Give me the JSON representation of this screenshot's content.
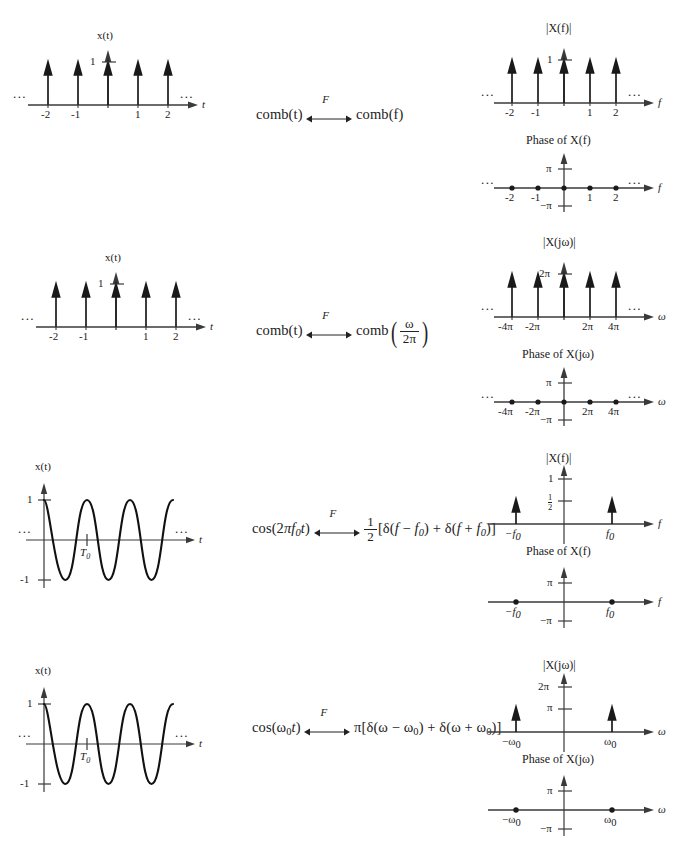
{
  "figure": {
    "type": "signal-transform-table",
    "rows": [
      {
        "id": "row1-comb-f",
        "time_plot": {
          "y_axis_label": "x(t)",
          "x_axis_label": "t",
          "y_tick_labels": [
            "1"
          ],
          "x_tick_labels": [
            "-2",
            "-1",
            "1",
            "2"
          ],
          "left_ellipsis": "...",
          "right_ellipsis": "...",
          "impulse_positions": [
            -2,
            -1,
            0,
            1,
            2
          ],
          "impulse_height": 1
        },
        "equation": {
          "lhs": "comb(t)",
          "operator_label": "F",
          "rhs": "comb(f)"
        },
        "magnitude_plot": {
          "title": "|X(f)|",
          "x_axis_label": "f",
          "y_tick_labels": [
            "1"
          ],
          "x_tick_labels": [
            "-2",
            "-1",
            "1",
            "2"
          ],
          "left_ellipsis": "...",
          "right_ellipsis": "...",
          "impulse_positions": [
            -2,
            -1,
            0,
            1,
            2
          ],
          "impulse_height": 1
        },
        "phase_plot": {
          "title": "Phase of X(f)",
          "x_axis_label": "f",
          "y_tick_labels": [
            "π",
            "−π"
          ],
          "x_tick_labels": [
            "-2",
            "-1",
            "1",
            "2"
          ],
          "left_ellipsis": "...",
          "right_ellipsis": "...",
          "point_positions": [
            -2,
            -1,
            0,
            1,
            2
          ],
          "point_values": [
            0,
            0,
            0,
            0,
            0
          ]
        }
      },
      {
        "id": "row2-comb-omega",
        "time_plot": {
          "y_axis_label": "x(t)",
          "x_axis_label": "t",
          "y_tick_labels": [
            "1"
          ],
          "x_tick_labels": [
            "-2",
            "-1",
            "1",
            "2"
          ],
          "left_ellipsis": "...",
          "right_ellipsis": "...",
          "impulse_positions": [
            -2,
            -1,
            0,
            1,
            2
          ],
          "impulse_height": 1
        },
        "equation": {
          "lhs": "comb(t)",
          "operator_label": "F",
          "rhs_prefix": "comb",
          "rhs_fraction_num": "ω",
          "rhs_fraction_den": "2π"
        },
        "magnitude_plot": {
          "title": "|X(jω)|",
          "x_axis_label": "ω",
          "y_tick_labels": [
            "2π"
          ],
          "x_tick_labels": [
            "-4π",
            "-2π",
            "2π",
            "4π"
          ],
          "left_ellipsis": "...",
          "right_ellipsis": "...",
          "impulse_positions": [
            -2,
            -1,
            0,
            1,
            2
          ],
          "impulse_height": 1
        },
        "phase_plot": {
          "title": "Phase of X(jω)",
          "x_axis_label": "ω",
          "y_tick_labels": [
            "π",
            "−π"
          ],
          "x_tick_labels": [
            "-4π",
            "-2π",
            "2π",
            "4π"
          ],
          "left_ellipsis": "...",
          "right_ellipsis": "...",
          "point_positions": [
            -2,
            -1,
            0,
            1,
            2
          ],
          "point_values": [
            0,
            0,
            0,
            0,
            0
          ]
        }
      },
      {
        "id": "row3-cos-f",
        "time_plot": {
          "y_axis_label": "x(t)",
          "x_axis_label": "t",
          "y_tick_labels": [
            "1",
            "-1"
          ],
          "period_label": "T0",
          "left_ellipsis": "...",
          "right_ellipsis": "...",
          "waveform": "cosine",
          "amplitude": 1
        },
        "equation": {
          "lhs": "cos(2πf0t)",
          "operator_label": "F",
          "rhs": "1/2 [δ(f − f0) + δ(f + f0)]"
        },
        "magnitude_plot": {
          "title": "|X(f)|",
          "x_axis_label": "f",
          "y_tick_labels": [
            "1",
            "1/2"
          ],
          "x_tick_labels": [
            "-f0",
            "f0"
          ],
          "impulse_positions": [
            -1,
            1
          ],
          "impulse_height": 0.5
        },
        "phase_plot": {
          "title": "Phase of X(f)",
          "x_axis_label": "f",
          "y_tick_labels": [
            "π",
            "−π"
          ],
          "x_tick_labels": [
            "-f0",
            "f0"
          ],
          "point_positions": [
            -1,
            1
          ],
          "point_values": [
            0,
            0
          ]
        }
      },
      {
        "id": "row4-cos-omega",
        "time_plot": {
          "y_axis_label": "x(t)",
          "x_axis_label": "t",
          "y_tick_labels": [
            "1",
            "-1"
          ],
          "period_label": "T0",
          "left_ellipsis": "...",
          "right_ellipsis": "...",
          "waveform": "cosine",
          "amplitude": 1
        },
        "equation": {
          "lhs": "cos(ω0t)",
          "operator_label": "F",
          "rhs": "π[δ(ω − ω0) + δ(ω + ω0)]"
        },
        "magnitude_plot": {
          "title": "|X(jω)|",
          "x_axis_label": "ω",
          "y_tick_labels": [
            "2π",
            "π"
          ],
          "x_tick_labels": [
            "-ω0",
            "ω0"
          ],
          "impulse_positions": [
            -1,
            1
          ],
          "impulse_height": 0.5
        },
        "phase_plot": {
          "title": "Phase of X(jω)",
          "x_axis_label": "ω",
          "y_tick_labels": [
            "π",
            "−π"
          ],
          "x_tick_labels": [
            "-ω0",
            "ω0"
          ],
          "point_positions": [
            -1,
            1
          ],
          "point_values": [
            0,
            0
          ]
        }
      }
    ],
    "colors": {
      "ink": "#1a1a1a",
      "axis": "#3a3a3a",
      "background": "#ffffff"
    }
  }
}
